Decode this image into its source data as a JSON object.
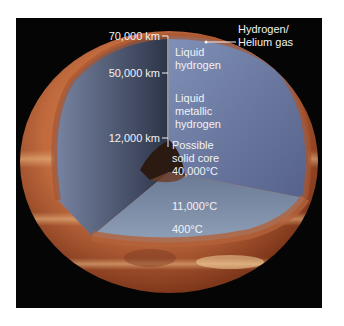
{
  "diagram": {
    "colors": {
      "background": "#050505",
      "atmosphere": "#b8603a",
      "liquid_hydrogen": "#6f7fa6",
      "metallic_hydrogen": "#46506a",
      "core": "#2a1a12",
      "text": "#f2f2f2"
    },
    "depth_labels": [
      {
        "text": "70,000 km"
      },
      {
        "text": "50,000 km"
      },
      {
        "text": "12,000 km"
      }
    ],
    "layers": {
      "outer_gas": {
        "line1": "Hydrogen/",
        "line2": "Helium gas"
      },
      "liquid_hydrogen": {
        "line1": "Liquid",
        "line2": "hydrogen"
      },
      "metallic_hydrogen": {
        "line1": "Liquid",
        "line2": "metallic",
        "line3": "hydrogen"
      },
      "core": {
        "line1": "Possible",
        "line2": "solid core",
        "line3": "40,000°C"
      }
    },
    "temperatures": {
      "metallic_boundary": "11,000°C",
      "outer_boundary": "400°C"
    }
  }
}
